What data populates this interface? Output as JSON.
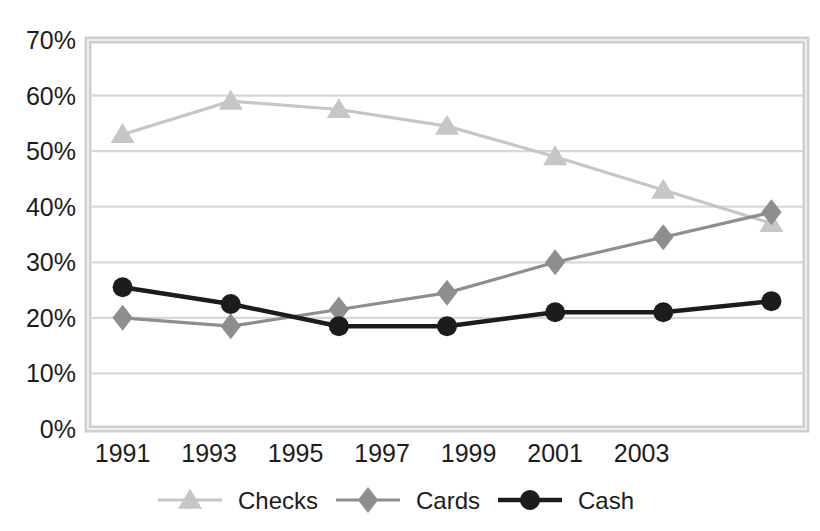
{
  "chart_data": {
    "type": "line",
    "title": "",
    "subtitle": "",
    "xlabel": "",
    "ylabel": "",
    "x": [
      1991,
      1993.5,
      1996,
      1998.5,
      2001,
      2003.5,
      2006
    ],
    "categories": [
      "1991",
      "1993",
      "1995",
      "1997",
      "1999",
      "2001",
      "2003"
    ],
    "xtick_labels": [
      "1991",
      "1993",
      "1995",
      "1997",
      "1999",
      "2001",
      "2003"
    ],
    "xtick_values": [
      1991,
      1993,
      1995,
      1997,
      1999,
      2001,
      2003
    ],
    "ytick_labels": [
      "0%",
      "10%",
      "20%",
      "30%",
      "40%",
      "50%",
      "60%",
      "70%"
    ],
    "ytick_values": [
      0,
      10,
      20,
      30,
      40,
      50,
      60,
      70
    ],
    "ylim": [
      0,
      70
    ],
    "xlim": [
      1990.2,
      2006.8
    ],
    "grid": true,
    "grid_axis": "y",
    "legend_position": "bottom",
    "series": [
      {
        "name": "Checks",
        "marker": "triangle",
        "color": "#c6c6c6",
        "values": [
          53,
          59,
          57.5,
          54.5,
          49,
          43,
          37
        ]
      },
      {
        "name": "Cards",
        "marker": "diamond",
        "color": "#8e8e8e",
        "values": [
          20,
          18.5,
          21.5,
          24.5,
          30,
          34.5,
          39
        ]
      },
      {
        "name": "Cash",
        "marker": "circle",
        "color": "#1c1c1c",
        "values": [
          25.5,
          22.5,
          18.5,
          18.5,
          21,
          21,
          23
        ]
      }
    ]
  },
  "legend": {
    "items": [
      {
        "label": "Checks",
        "marker": "triangle",
        "color": "#c6c6c6"
      },
      {
        "label": "Cards",
        "marker": "diamond",
        "color": "#8e8e8e"
      },
      {
        "label": "Cash",
        "marker": "circle",
        "color": "#1c1c1c"
      }
    ]
  },
  "axes": {
    "y_labels": [
      "70%",
      "60%",
      "50%",
      "40%",
      "30%",
      "20%",
      "10%",
      "0%"
    ],
    "x_labels": [
      "1991",
      "1993",
      "1995",
      "1997",
      "1999",
      "2001",
      "2003"
    ]
  },
  "colors": {
    "checks": "#c6c6c6",
    "cards": "#8e8e8e",
    "cash": "#1c1c1c",
    "gridline": "#d8d8d8",
    "axis_border": "#c9c9c9",
    "background": "#ffffff",
    "text": "#1c1c1c"
  }
}
